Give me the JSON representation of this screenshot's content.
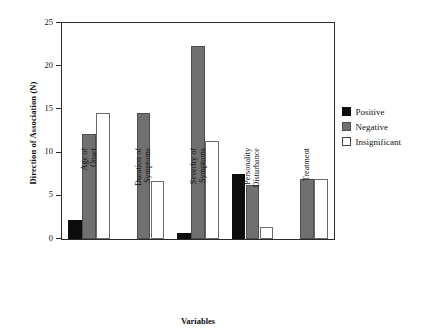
{
  "chart_data": {
    "type": "bar",
    "title": "",
    "xlabel": "Variables",
    "ylabel": "Direction of Association (N)",
    "ylim": [
      0,
      25
    ],
    "yticks": [
      0,
      5,
      10,
      15,
      20,
      25
    ],
    "grid": false,
    "legend_position": "right",
    "categories": [
      "Age of\nOnset",
      "Duration of\nSymptoms",
      "Severity of\nSymptoms",
      "Personality\nDisturbance",
      "Treatment"
    ],
    "category_lines": [
      [
        "Age of",
        "Onset"
      ],
      [
        "Duration of",
        "Symptoms"
      ],
      [
        "Severity of",
        "Symptoms"
      ],
      [
        "Personality",
        "Disturbance"
      ],
      [
        "Treatment"
      ]
    ],
    "series": [
      {
        "name": "Positive",
        "color": "#0d0d0d",
        "values": [
          2.2,
          0,
          0.7,
          7.5,
          0
        ]
      },
      {
        "name": "Negative",
        "color": "#707070",
        "values": [
          12.2,
          14.6,
          22.3,
          6.2,
          7.0
        ]
      },
      {
        "name": "Insignificant",
        "color": "#ffffff",
        "values": [
          14.6,
          6.7,
          11.4,
          1.4,
          7.0
        ]
      }
    ]
  },
  "legend": {
    "items": [
      {
        "label": "Positive"
      },
      {
        "label": "Negative"
      },
      {
        "label": "Insignificant"
      }
    ]
  },
  "axis": {
    "y_title": "Direction of Association (N)",
    "x_title": "Variables",
    "y_tick_labels": [
      "0",
      "5",
      "10",
      "15",
      "20",
      "25"
    ]
  }
}
